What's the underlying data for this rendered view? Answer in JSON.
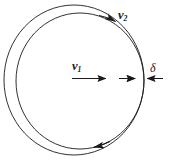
{
  "figure": {
    "background_color": "#ffffff",
    "stroke_color": "#1a1a1a",
    "labels": {
      "v1": {
        "symbol": "v",
        "subscript": "1",
        "text": "v"
      },
      "v2": {
        "symbol": "v",
        "subscript": "2",
        "text": "v"
      },
      "delta": {
        "text": "δ"
      }
    },
    "annotations": {
      "v1_description": "axial velocity arrow pointing right through the centre",
      "v2_description": "tangential velocity arrow on the inner circle at the upper right",
      "delta_description": "gap thickness between the inner and outer circles at the right",
      "flow_direction": "clockwise"
    },
    "geometry": {
      "outer_circle": {
        "cx": 74,
        "cy": 80,
        "rx": 70,
        "ry": 75
      },
      "inner_circle": {
        "cx": 80,
        "cy": 81,
        "rx": 64,
        "ry": 68
      }
    }
  }
}
